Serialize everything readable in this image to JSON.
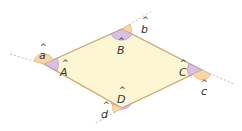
{
  "diagram": {
    "shape": "rhombus",
    "colors": {
      "fill": "#fdf6d3",
      "stroke": "#c8a66a",
      "interior_angle": "#c9a6d8",
      "exterior_angle": "#f3c98e",
      "extension": "#bdbdbd"
    },
    "interior_angles": [
      {
        "vertex": "A",
        "label": "A"
      },
      {
        "vertex": "B",
        "label": "B"
      },
      {
        "vertex": "C",
        "label": "C"
      },
      {
        "vertex": "D",
        "label": "D"
      }
    ],
    "exterior_angles": [
      {
        "vertex": "A",
        "label": "a"
      },
      {
        "vertex": "B",
        "label": "b"
      },
      {
        "vertex": "C",
        "label": "c"
      },
      {
        "vertex": "D",
        "label": "d"
      }
    ],
    "hat": "^"
  }
}
